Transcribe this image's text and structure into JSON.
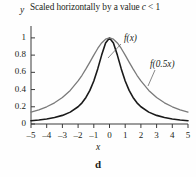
{
  "figure": {
    "panel_label": "d"
  },
  "chart_data": {
    "type": "line",
    "title": "Scaled horizontally by a value c < 1",
    "title_parts": {
      "before": "Scaled horizontally by a value ",
      "variable": "c",
      "after": " < 1"
    },
    "xlabel": "x",
    "ylabel": "y",
    "xlim": [
      -5,
      5
    ],
    "ylim": [
      0,
      1.08
    ],
    "grid": false,
    "legend_position": "inline-annotations",
    "xticks": [
      -5,
      -4,
      -3,
      -2,
      -1,
      0,
      1,
      2,
      3,
      4,
      5
    ],
    "xtick_labels": [
      "–5",
      "–4",
      "–3",
      "–2",
      "–1",
      "0",
      "1",
      "2",
      "3",
      "4",
      "5"
    ],
    "yticks": [
      0,
      0.2,
      0.4,
      0.6,
      0.8,
      1
    ],
    "ytick_labels": [
      "0",
      "0.2",
      "0.4",
      "0.6",
      "0.8",
      "1"
    ],
    "series": [
      {
        "name": "f(x)",
        "color": "#1a1a1a",
        "width": 1.6,
        "label_x": 124,
        "label_y": 33,
        "leader": [
          121,
          44,
          108,
          58
        ],
        "x": [
          -5,
          -4.5,
          -4,
          -3.5,
          -3,
          -2.5,
          -2,
          -1.75,
          -1.5,
          -1.25,
          -1,
          -0.75,
          -0.5,
          -0.25,
          0,
          0.25,
          0.5,
          0.75,
          1,
          1.25,
          1.5,
          1.75,
          2,
          2.5,
          3,
          3.5,
          4,
          4.5,
          5
        ],
        "y": [
          0.038,
          0.047,
          0.059,
          0.075,
          0.1,
          0.138,
          0.2,
          0.246,
          0.308,
          0.39,
          0.5,
          0.64,
          0.8,
          0.941,
          1,
          0.941,
          0.8,
          0.64,
          0.5,
          0.39,
          0.308,
          0.246,
          0.2,
          0.138,
          0.1,
          0.075,
          0.059,
          0.047,
          0.038
        ]
      },
      {
        "name": "f(0.5x)",
        "color": "#7a7a7a",
        "width": 1.3,
        "label_x": 150,
        "label_y": 59,
        "leader": [
          155,
          70,
          148,
          86
        ],
        "x": [
          -5,
          -4.5,
          -4,
          -3.5,
          -3,
          -2.5,
          -2,
          -1.75,
          -1.5,
          -1.25,
          -1,
          -0.75,
          -0.5,
          -0.25,
          0,
          0.25,
          0.5,
          0.75,
          1,
          1.25,
          1.5,
          1.75,
          2,
          2.5,
          3,
          3.5,
          4,
          4.5,
          5
        ],
        "y": [
          0.138,
          0.165,
          0.2,
          0.246,
          0.308,
          0.39,
          0.5,
          0.566,
          0.64,
          0.719,
          0.8,
          0.877,
          0.941,
          0.985,
          1,
          0.985,
          0.941,
          0.877,
          0.8,
          0.719,
          0.64,
          0.566,
          0.5,
          0.39,
          0.308,
          0.246,
          0.2,
          0.165,
          0.138
        ]
      }
    ]
  }
}
